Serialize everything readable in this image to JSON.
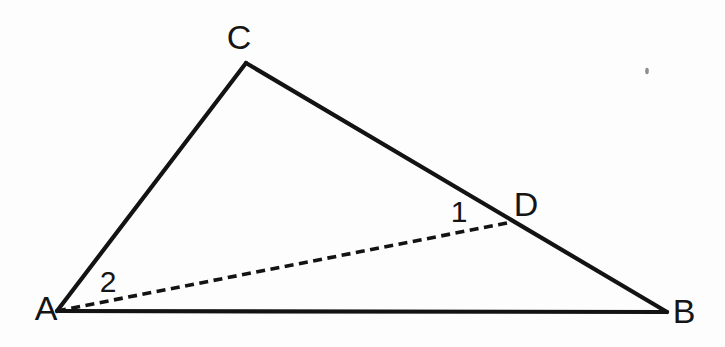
{
  "figure": {
    "type": "geometry-diagram",
    "background_color": "#fdfdfd",
    "stroke_color": "#131313",
    "width": 725,
    "height": 347
  },
  "points": {
    "A": {
      "label": "A",
      "x": 57,
      "y": 311,
      "label_x": 46,
      "label_y": 311
    },
    "B": {
      "label": "B",
      "x": 667,
      "y": 312,
      "label_x": 684,
      "label_y": 314
    },
    "C": {
      "label": "C",
      "x": 246,
      "y": 63,
      "label_x": 239,
      "label_y": 40
    },
    "D": {
      "label": "D",
      "x": 507,
      "y": 223,
      "label_x": 526,
      "label_y": 207
    }
  },
  "angles": [
    {
      "label": "1",
      "x": 459,
      "y": 214,
      "at_vertex": "D",
      "description": "angle ADC"
    },
    {
      "label": "2",
      "x": 108,
      "y": 284,
      "at_vertex": "A",
      "description": "angle DAC"
    }
  ],
  "segments": [
    {
      "name": "AC",
      "from": "A",
      "to": "C",
      "style": "solid"
    },
    {
      "name": "CB",
      "from": "C",
      "to": "B",
      "style": "solid"
    },
    {
      "name": "AB",
      "from": "A",
      "to": "B",
      "style": "solid"
    },
    {
      "name": "AD",
      "from": "A",
      "to": "D",
      "style": "dashed"
    }
  ],
  "artifacts": [
    {
      "name": "scan-speck",
      "x": 647,
      "y": 71,
      "rx": 1.8,
      "ry": 3.2
    }
  ]
}
